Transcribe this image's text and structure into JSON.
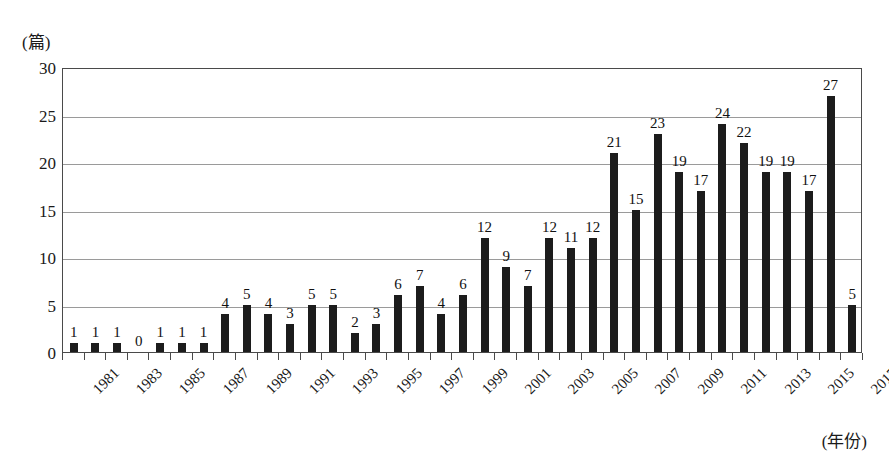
{
  "chart_data": {
    "type": "bar",
    "title": "",
    "subtitle": "",
    "xlabel": "(年份)",
    "ylabel": "(篇)",
    "ylim": [
      0,
      30
    ],
    "yticks": [
      0,
      5,
      10,
      15,
      20,
      25,
      30
    ],
    "grid": true,
    "legend": null,
    "categories": [
      "1981",
      "1982",
      "1983",
      "1984",
      "1985",
      "1986",
      "1987",
      "1988",
      "1989",
      "1990",
      "1991",
      "1992",
      "1993",
      "1994",
      "1995",
      "1996",
      "1997",
      "1998",
      "1999",
      "2000",
      "2001",
      "2002",
      "2003",
      "2004",
      "2005",
      "2006",
      "2007",
      "2008",
      "2009",
      "2010",
      "2011",
      "2012",
      "2013",
      "2014",
      "2015",
      "2016",
      "2017"
    ],
    "tick_labels": [
      "1981",
      "1983",
      "1985",
      "1987",
      "1989",
      "1991",
      "1993",
      "1995",
      "1997",
      "1999",
      "2001",
      "2003",
      "2005",
      "2007",
      "2009",
      "2011",
      "2013",
      "2015",
      "2017"
    ],
    "values": [
      1,
      1,
      1,
      0,
      1,
      1,
      1,
      4,
      5,
      4,
      3,
      5,
      5,
      2,
      3,
      6,
      7,
      4,
      6,
      12,
      9,
      7,
      12,
      11,
      12,
      21,
      15,
      23,
      19,
      17,
      24,
      22,
      19,
      19,
      17,
      27,
      5
    ],
    "data_labels": [
      "1",
      "1",
      "1",
      "0",
      "1",
      "1",
      "1",
      "4",
      "5",
      "4",
      "3",
      "5",
      "5",
      "2",
      "3",
      "6",
      "7",
      "4",
      "6",
      "12",
      "9",
      "7",
      "12",
      "11",
      "12",
      "21",
      "15",
      "23",
      "19",
      "17",
      "24",
      "22",
      "19",
      "19",
      "17",
      "27",
      "5"
    ],
    "bar_color": "#1c1c1c",
    "grid_color": "#9a9a9a",
    "frame_color": "#4a4a4a"
  }
}
